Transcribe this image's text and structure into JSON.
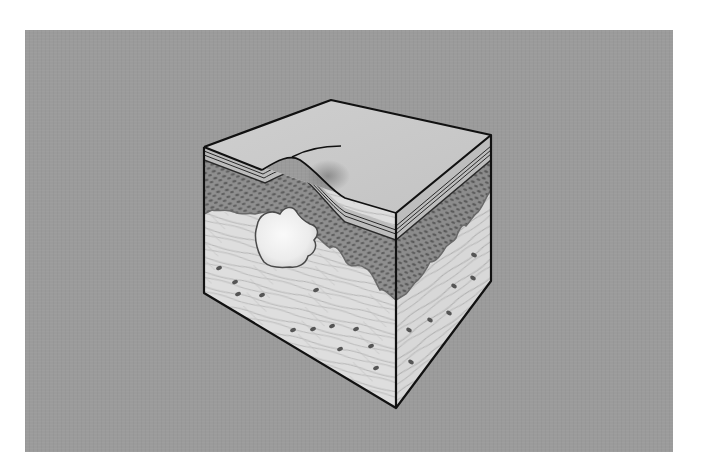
{
  "figure": {
    "colors": {
      "page_background": "#ffffff",
      "panel_background": "#9b9b9b",
      "top_surface": "#c9c9c9",
      "epidermis": "#8f8f8f",
      "epidermis_cells": "#5e5e5e",
      "dermis": "#dcdcdc",
      "dermis_fibers": "#a8a8a8",
      "dermis_cells": "#555555",
      "blister": "#f4f4f4",
      "outline": "#111111"
    },
    "geometry": {
      "top_back": [
        331,
        100
      ],
      "top_left": [
        204,
        147
      ],
      "top_right": [
        491,
        135
      ],
      "top_front": [
        396,
        213
      ],
      "bottom_left": [
        204,
        293
      ],
      "bottom_right": [
        491,
        281
      ],
      "bottom_front": [
        396,
        408
      ]
    },
    "regions": [
      {
        "name": "surface",
        "label": ""
      },
      {
        "name": "stratum-layers",
        "label": ""
      },
      {
        "name": "epidermis",
        "label": ""
      },
      {
        "name": "blister",
        "label": ""
      },
      {
        "name": "dermis",
        "label": ""
      }
    ]
  }
}
